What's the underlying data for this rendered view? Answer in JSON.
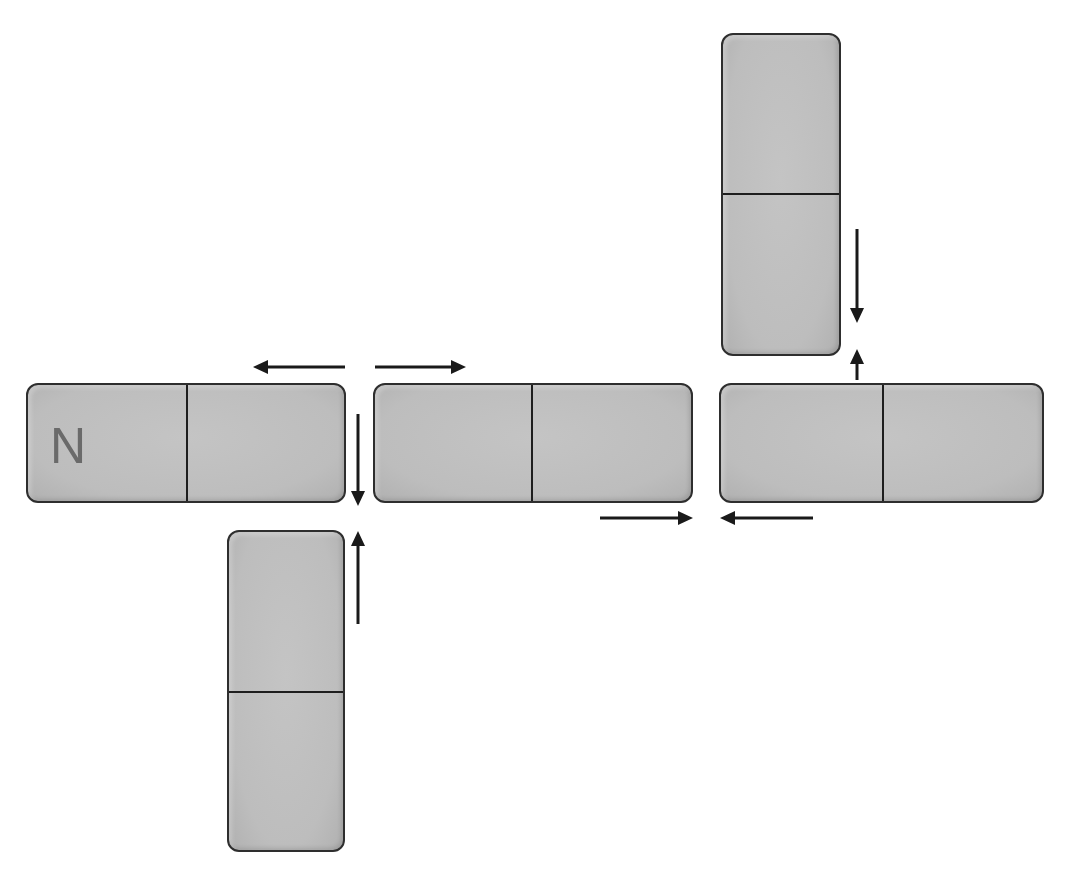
{
  "diagram": {
    "type": "domino-layout",
    "background": "#ffffff",
    "tile_color": "#bfbfbf",
    "border_color": "#2e2e2e",
    "arrow_color": "#1a1a1a",
    "dominoes": [
      {
        "id": "d1",
        "orientation": "horizontal",
        "label": "N",
        "x": 26,
        "y": 383,
        "w": 320,
        "h": 120,
        "divider": 160
      },
      {
        "id": "d2",
        "orientation": "horizontal",
        "label": "",
        "x": 373,
        "y": 383,
        "w": 320,
        "h": 120,
        "divider": 158
      },
      {
        "id": "d3",
        "orientation": "horizontal",
        "label": "",
        "x": 719,
        "y": 383,
        "w": 325,
        "h": 120,
        "divider": 163
      },
      {
        "id": "d4",
        "orientation": "vertical",
        "label": "",
        "x": 227,
        "y": 530,
        "w": 118,
        "h": 322,
        "divider": 161
      },
      {
        "id": "d5",
        "orientation": "vertical",
        "label": "",
        "x": 721,
        "y": 33,
        "w": 120,
        "h": 323,
        "divider": 160
      }
    ],
    "arrows": [
      {
        "id": "a1",
        "direction": "left",
        "x1": 345,
        "y1": 367,
        "x2": 253,
        "y2": 367
      },
      {
        "id": "a2",
        "direction": "right",
        "x1": 375,
        "y1": 367,
        "x2": 466,
        "y2": 367
      },
      {
        "id": "a3",
        "direction": "down",
        "x1": 358,
        "y1": 414,
        "x2": 358,
        "y2": 506
      },
      {
        "id": "a4",
        "direction": "up",
        "x1": 358,
        "y1": 624,
        "x2": 358,
        "y2": 531
      },
      {
        "id": "a5",
        "direction": "right",
        "x1": 600,
        "y1": 518,
        "x2": 693,
        "y2": 518
      },
      {
        "id": "a6",
        "direction": "left",
        "x1": 813,
        "y1": 518,
        "x2": 720,
        "y2": 518
      },
      {
        "id": "a7",
        "direction": "down",
        "x1": 857,
        "y1": 229,
        "x2": 857,
        "y2": 323
      },
      {
        "id": "a8",
        "direction": "up",
        "x1": 857,
        "y1": 380,
        "x2": 857,
        "y2": 349
      }
    ]
  }
}
